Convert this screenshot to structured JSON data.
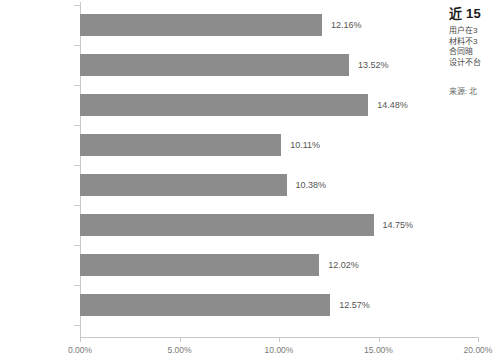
{
  "chart_data": {
    "type": "bar",
    "orientation": "horizontal",
    "title": "",
    "xlabel": "",
    "ylabel": "",
    "categories": [
      "售后保障欠缺",
      "材料不环保",
      "装修质量差",
      "工期拖延",
      "设计不合理",
      "偷工减料",
      "预算超出太多",
      "装修合同暗藏陷阱"
    ],
    "values": [
      12.16,
      13.52,
      14.48,
      10.11,
      10.38,
      14.75,
      12.02,
      12.57
    ],
    "value_labels": [
      "12.16%",
      "13.52%",
      "14.48%",
      "10.11%",
      "10.38%",
      "14.75%",
      "12.02%",
      "12.57%"
    ],
    "xlim": [
      0,
      20
    ],
    "xticks": [
      0,
      5,
      10,
      15,
      20
    ],
    "xtick_labels": [
      "0.00%",
      "5.00%",
      "10.00%",
      "15.00%",
      "20.00%"
    ],
    "grid": false,
    "legend": null,
    "bar_color": "#8c8c8c",
    "axis_color": "#c9c9c9"
  },
  "side_panel": {
    "title": "近 15",
    "lines": [
      "用户在3",
      "材料不3",
      "合同暗",
      "设计不台"
    ],
    "source": "来源: 北"
  }
}
